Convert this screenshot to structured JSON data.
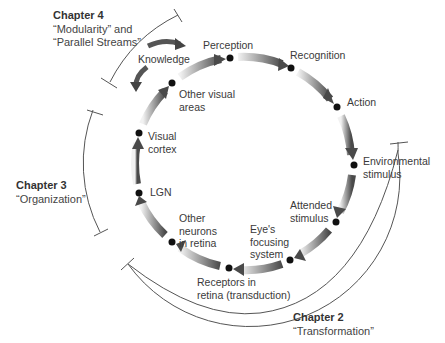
{
  "diagram": {
    "type": "perceptual-process-cycle",
    "center": [
      244,
      166
    ],
    "radius": 107,
    "stages": [
      {
        "id": "perception",
        "label": "Perception",
        "dot": [
          230,
          58
        ]
      },
      {
        "id": "recognition",
        "label": "Recognition",
        "dot": [
          291,
          68
        ]
      },
      {
        "id": "action",
        "label": "Action",
        "dot": [
          337,
          107
        ]
      },
      {
        "id": "environmental",
        "label": "Environmental\nstimulus",
        "dot": [
          354,
          165
        ]
      },
      {
        "id": "attended",
        "label": "Attended\nstimulus",
        "dot": [
          336,
          222
        ]
      },
      {
        "id": "eyes",
        "label": "Eye's\nfocusing\nsystem",
        "dot": [
          290,
          260
        ]
      },
      {
        "id": "receptors",
        "label": "Receptors in\nretina (transduction)",
        "dot": [
          229,
          268
        ]
      },
      {
        "id": "other-neurons",
        "label": "Other\nneurons\nin retina",
        "dot": [
          172,
          242
        ]
      },
      {
        "id": "lgn",
        "label": "LGN",
        "dot": [
          139,
          193
        ]
      },
      {
        "id": "visual-cortex",
        "label": "Visual\ncortex",
        "dot": [
          139,
          133
        ]
      },
      {
        "id": "other-visual",
        "label": "Other visual\nareas",
        "dot": [
          172,
          83
        ]
      }
    ],
    "knowledge": {
      "label": "Knowledge"
    },
    "chapters": [
      {
        "title": "Chapter 4",
        "subtitle": "“Modularity” and\n“Parallel Streams”"
      },
      {
        "title": "Chapter 3",
        "subtitle": "“Organization”"
      },
      {
        "title": "Chapter 2",
        "subtitle": "“Transformation”"
      }
    ],
    "colors": {
      "arrow_dark": "#555555",
      "arrow_light": "#e8e8e8",
      "dot": "#111111",
      "bracket": "#444444"
    }
  }
}
